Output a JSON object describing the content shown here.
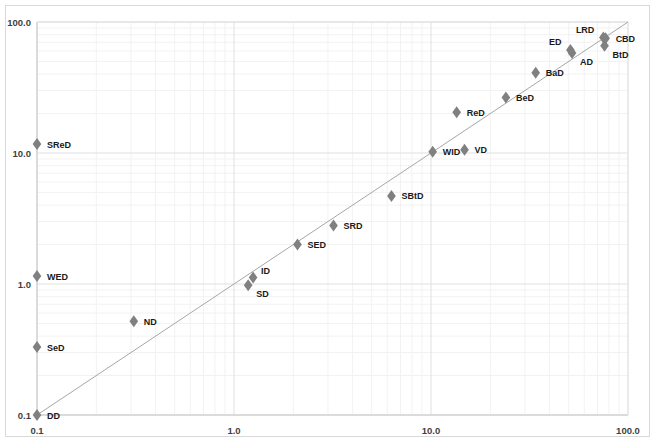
{
  "chart_data": {
    "type": "scatter",
    "title": "",
    "xlabel": "",
    "ylabel": "",
    "xscale": "log",
    "yscale": "log",
    "xlim": [
      0.1,
      100.0
    ],
    "ylim": [
      0.1,
      100.0
    ],
    "grid": true,
    "minor_grid": true,
    "legend": "none",
    "x_ticks": [
      "0.1",
      "1.0",
      "10.0",
      "100.0"
    ],
    "x_tick_values": [
      0.1,
      1.0,
      10.0,
      100.0
    ],
    "y_ticks": [
      "0.1",
      "1.0",
      "10.0",
      "100.0"
    ],
    "y_tick_values": [
      0.1,
      1.0,
      10.0,
      100.0
    ],
    "reference_line": {
      "name": "identity-line",
      "from": [
        0.1,
        0.1
      ],
      "to": [
        100.0,
        100.0
      ],
      "color": "#a6a6a6"
    },
    "marker": {
      "shape": "diamond",
      "color": "#808080",
      "size": 6
    },
    "points": [
      {
        "label": "DD",
        "x": 0.1,
        "y": 0.1,
        "label_pos": "right"
      },
      {
        "label": "SeD",
        "x": 0.1,
        "y": 0.33,
        "label_pos": "right"
      },
      {
        "label": "WED",
        "x": 0.1,
        "y": 1.15,
        "label_pos": "right"
      },
      {
        "label": "SReD",
        "x": 0.1,
        "y": 11.7,
        "label_pos": "right"
      },
      {
        "label": "ND",
        "x": 0.31,
        "y": 0.52,
        "label_pos": "right"
      },
      {
        "label": "SD",
        "x": 1.18,
        "y": 0.98,
        "label_pos": "below-right"
      },
      {
        "label": "ID",
        "x": 1.25,
        "y": 1.12,
        "label_pos": "above-right"
      },
      {
        "label": "SED",
        "x": 2.1,
        "y": 2.0,
        "label_pos": "right"
      },
      {
        "label": "SRD",
        "x": 3.2,
        "y": 2.8,
        "label_pos": "right"
      },
      {
        "label": "SBtD",
        "x": 6.3,
        "y": 4.7,
        "label_pos": "right"
      },
      {
        "label": "WID",
        "x": 10.2,
        "y": 10.2,
        "label_pos": "right"
      },
      {
        "label": "VD",
        "x": 14.8,
        "y": 10.6,
        "label_pos": "right"
      },
      {
        "label": "ReD",
        "x": 13.5,
        "y": 20.5,
        "label_pos": "right"
      },
      {
        "label": "BeD",
        "x": 24.0,
        "y": 26.5,
        "label_pos": "right"
      },
      {
        "label": "BaD",
        "x": 34.0,
        "y": 41.0,
        "label_pos": "right"
      },
      {
        "label": "ED",
        "x": 51.0,
        "y": 61.0,
        "label_pos": "above-left"
      },
      {
        "label": "AD",
        "x": 52.0,
        "y": 58.0,
        "label_pos": "below-right"
      },
      {
        "label": "LRD",
        "x": 75.0,
        "y": 76.0,
        "label_pos": "above-left"
      },
      {
        "label": "CBD",
        "x": 77.0,
        "y": 75.0,
        "label_pos": "right"
      },
      {
        "label": "BtD",
        "x": 76.0,
        "y": 66.0,
        "label_pos": "below-right"
      }
    ]
  }
}
